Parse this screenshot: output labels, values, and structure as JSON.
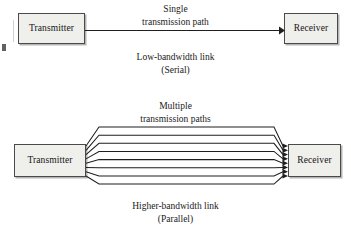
{
  "figure": {
    "background_color": "#ffffff",
    "line_color": "#1f1f1f",
    "box_fill_color": "#efefec",
    "box_border_color": "#4a4a4a"
  },
  "serial": {
    "transmitter_label": "Transmitter",
    "receiver_label": "Receiver",
    "path_caption_line1": "Single",
    "path_caption_line2": "transmission path",
    "link_caption_line1": "Low-bandwidth link",
    "link_caption_line2": "(Serial)",
    "path_count": 1
  },
  "parallel": {
    "transmitter_label": "Transmitter",
    "receiver_label": "Receiver",
    "path_caption_line1": "Multiple",
    "path_caption_line2": "transmission paths",
    "link_caption_line1": "Higher-bandwidth link",
    "link_caption_line2": "(Parallel)",
    "path_count": 8
  }
}
